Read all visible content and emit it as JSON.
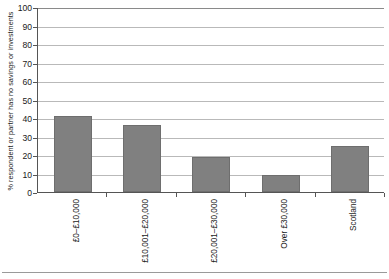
{
  "chart_data": {
    "type": "bar",
    "title": "",
    "xlabel": "",
    "ylabel": "% respondent or partner has no savings or investments",
    "ylim": [
      0,
      100
    ],
    "ytick_step": 10,
    "yticks": [
      100,
      90,
      80,
      70,
      60,
      50,
      40,
      30,
      20,
      10,
      0
    ],
    "grid": true,
    "legend": false,
    "bar_color": "#808080",
    "categories": [
      "£0–£10,000",
      "£10,001–£20,000",
      "£20,001–£30,000",
      "Over £30,000",
      "Scotland"
    ],
    "values": [
      41,
      36,
      19,
      9,
      25
    ]
  }
}
